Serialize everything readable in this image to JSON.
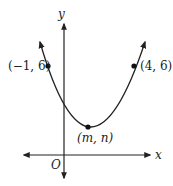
{
  "diagram": {
    "type": "parabola-graph",
    "axes": {
      "x_label": "x",
      "y_label": "y",
      "origin_label": "O"
    },
    "points": [
      {
        "label": "(−1, 6)",
        "x": -1,
        "y": 6
      },
      {
        "label": "(4, 6)",
        "x": 4,
        "y": 6
      },
      {
        "label": "(m, n)",
        "x": "m",
        "y": "n",
        "role": "vertex"
      }
    ],
    "colors": {
      "stroke": "#222222",
      "background": "#ffffff"
    }
  }
}
